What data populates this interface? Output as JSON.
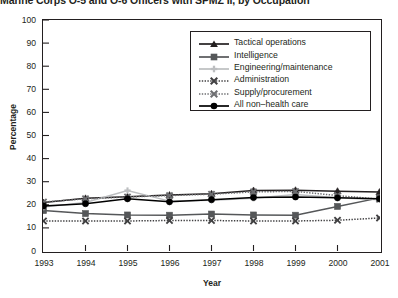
{
  "title": "Marine Corps O-5 and O-6 Officers with SPMZ II, by Occupation",
  "axis": {
    "ylabel": "Percentage",
    "xlabel": "Year"
  },
  "legend": {
    "position": "top-right",
    "entries": [
      {
        "label": "Tactical operations",
        "marker": "triangle-up",
        "color": "#231f20",
        "line": "solid"
      },
      {
        "label": "Intelligence",
        "marker": "square",
        "color": "#555759",
        "line": "solid"
      },
      {
        "label": "Engineering/maintenance",
        "marker": "plus",
        "color": "#bcbec0",
        "line": "solid"
      },
      {
        "label": "Administration",
        "marker": "x-cross",
        "color": "#414042",
        "line": "dotted"
      },
      {
        "label": "Supply/procurement",
        "marker": "x-cross",
        "color": "#6d6e71",
        "line": "dotted"
      },
      {
        "label": "All non–health care",
        "marker": "circle",
        "color": "#000000",
        "line": "solid"
      }
    ]
  },
  "chart_data": {
    "type": "line",
    "title": "Marine Corps O-5 and O-6 Officers with SPMZ II, by Occupation",
    "xlabel": "Year",
    "ylabel": "Percentage",
    "x": [
      1993,
      1994,
      1995,
      1996,
      1997,
      1998,
      1999,
      2000,
      2001
    ],
    "categories": [
      "1993",
      "1994",
      "1995",
      "1996",
      "1997",
      "1998",
      "1999",
      "2000",
      "2001"
    ],
    "xlim": [
      1993,
      2001
    ],
    "ylim": [
      0,
      100
    ],
    "yticks": [
      0,
      10,
      20,
      30,
      40,
      50,
      60,
      70,
      80,
      90,
      100
    ],
    "grid": false,
    "series": [
      {
        "name": "Tactical operations",
        "marker": "triangle-up",
        "color": "#231f20",
        "line": "solid",
        "values": [
          21.0,
          22.8,
          23.5,
          24.2,
          24.8,
          26.2,
          26.3,
          25.9,
          25.5
        ]
      },
      {
        "name": "Intelligence",
        "marker": "square",
        "color": "#555759",
        "line": "solid",
        "values": [
          17.5,
          16.2,
          15.6,
          15.5,
          16.0,
          15.6,
          15.5,
          19.3,
          23.0
        ]
      },
      {
        "name": "Engineering/maintenance",
        "marker": "plus",
        "color": "#bcbec0",
        "line": "solid",
        "values": [
          19.0,
          21.0,
          26.2,
          21.6,
          22.0,
          22.8,
          24.5,
          23.0,
          22.2
        ]
      },
      {
        "name": "Administration",
        "marker": "x-cross",
        "color": "#414042",
        "line": "dotted",
        "values": [
          13.0,
          13.0,
          13.0,
          13.2,
          13.2,
          13.0,
          13.0,
          13.3,
          14.3
        ]
      },
      {
        "name": "Supply/procurement",
        "marker": "x-cross",
        "color": "#6d6e71",
        "line": "dotted",
        "values": [
          21.2,
          22.6,
          23.4,
          24.0,
          24.6,
          25.6,
          25.8,
          24.0,
          22.4
        ]
      },
      {
        "name": "All non–health care",
        "marker": "circle",
        "color": "#000000",
        "line": "solid",
        "values": [
          19.5,
          20.5,
          22.6,
          21.3,
          22.2,
          23.2,
          23.4,
          23.0,
          22.6
        ]
      }
    ]
  }
}
